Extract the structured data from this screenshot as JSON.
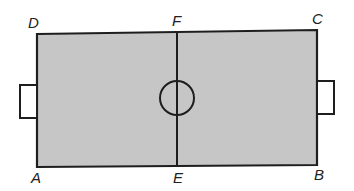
{
  "diagram": {
    "type": "football-field",
    "colors": {
      "field_fill": "#c6c6c6",
      "line": "#1e1e1e",
      "goal_fill": "#ffffff",
      "background": "#ffffff"
    },
    "points": {
      "A": {
        "label": "A"
      },
      "B": {
        "label": "B"
      },
      "C": {
        "label": "C"
      },
      "D": {
        "label": "D"
      },
      "E": {
        "label": "E"
      },
      "F": {
        "label": "F"
      }
    }
  }
}
